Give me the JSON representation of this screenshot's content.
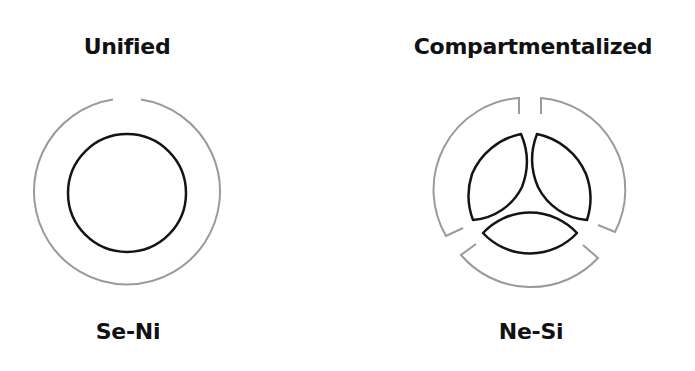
{
  "panels": [
    {
      "title": "Unified",
      "caption": "Se-Ni",
      "outer_color": "#9a9a9a",
      "inner_color": "#141414"
    },
    {
      "title": "Compartmentalized",
      "caption": "Ne-Si",
      "outer_color": "#9a9a9a",
      "inner_color": "#141414"
    }
  ]
}
